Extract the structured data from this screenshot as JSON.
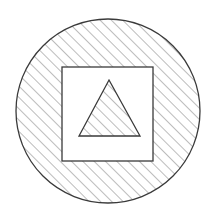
{
  "figure": {
    "title": "Hatched circle containing plain square with hatched triangle",
    "background_color": "#ffffff",
    "canvas": {
      "width": 217,
      "height": 218
    }
  },
  "style": {
    "stroke_color": "#3a3a3a",
    "hatch_color": "#6b6b6b",
    "fill_color": "#ffffff",
    "stroke_width": 1.3,
    "hatch_stroke_width": 0.9,
    "hatch_angle_degrees": 45,
    "hatch_spacing_px": 8
  },
  "shapes": [
    {
      "name": "circle",
      "type": "circle",
      "center_x": 108,
      "center_y": 111,
      "radius": 92,
      "hatched": true,
      "label": "Outer circle"
    },
    {
      "name": "square",
      "type": "rect",
      "x": 62,
      "y": 67,
      "width": 91,
      "height": 94,
      "hatched": false,
      "label": "Inner square"
    },
    {
      "name": "triangle",
      "type": "polygon",
      "points": "109,80 140,136 79,136",
      "hatched": true,
      "label": "Inner triangle"
    }
  ],
  "legend": {
    "hatched_region_label": "Shaded region",
    "plain_region_label": "Unshaded region"
  }
}
